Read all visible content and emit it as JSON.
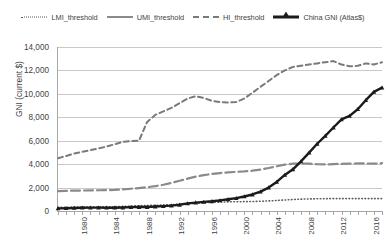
{
  "chart_data": {
    "type": "line",
    "title": "",
    "xlabel": "",
    "ylabel": "GNI (current $)",
    "xlim": [
      1980,
      2020
    ],
    "ylim": [
      0,
      14000
    ],
    "grid": true,
    "legend_position": "top",
    "x": [
      1980,
      1981,
      1982,
      1983,
      1984,
      1985,
      1986,
      1987,
      1988,
      1989,
      1990,
      1991,
      1992,
      1993,
      1994,
      1995,
      1996,
      1997,
      1998,
      1999,
      2000,
      2001,
      2002,
      2003,
      2004,
      2005,
      2006,
      2007,
      2008,
      2009,
      2010,
      2011,
      2012,
      2013,
      2014,
      2015,
      2016,
      2017,
      2018,
      2019,
      2020
    ],
    "x_tick_labels": [
      "1980",
      "1984",
      "1988",
      "1992",
      "1996",
      "2000",
      "2004",
      "2008",
      "2012",
      "2016",
      "2020"
    ],
    "y_tick_labels": [
      "0",
      "2,000",
      "4,000",
      "6,000",
      "8,000",
      "10,000",
      "12,000",
      "14,000"
    ],
    "y_ticks": [
      0,
      2000,
      4000,
      6000,
      8000,
      10000,
      12000,
      14000
    ],
    "series": [
      {
        "name": "LMI_threshold",
        "style": "dotted",
        "color": "#5d5d5d",
        "values": [
          310,
          320,
          330,
          340,
          340,
          350,
          360,
          370,
          390,
          420,
          450,
          470,
          490,
          510,
          540,
          580,
          620,
          660,
          700,
          740,
          760,
          780,
          790,
          800,
          810,
          830,
          860,
          900,
          940,
          980,
          1010,
          1030,
          1040,
          1050,
          1060,
          1060,
          1060,
          1060,
          1060,
          1060,
          1060
        ]
      },
      {
        "name": "UMI_threshold",
        "style": "solid-thin",
        "color": "#8a8a8a",
        "values": [
          1700,
          1720,
          1740,
          1750,
          1760,
          1770,
          1780,
          1800,
          1850,
          1900,
          1960,
          2030,
          2120,
          2240,
          2400,
          2580,
          2760,
          2930,
          3060,
          3160,
          3240,
          3300,
          3340,
          3380,
          3440,
          3540,
          3670,
          3820,
          3960,
          4040,
          4060,
          4040,
          4000,
          3980,
          4000,
          4030,
          4050,
          4060,
          4060,
          4040,
          4080
        ]
      },
      {
        "name": "HI_threshold",
        "style": "dashed",
        "color": "#7a7a7a",
        "values": [
          4500,
          4700,
          4900,
          5050,
          5200,
          5350,
          5500,
          5700,
          5900,
          5980,
          6000,
          7600,
          8200,
          8500,
          8800,
          9200,
          9600,
          9800,
          9650,
          9400,
          9300,
          9260,
          9300,
          9600,
          10100,
          10600,
          11100,
          11600,
          12000,
          12300,
          12400,
          12500,
          12600,
          12700,
          12800,
          12500,
          12350,
          12400,
          12600,
          12500,
          12700
        ]
      },
      {
        "name": "China GNI (Atlas$)",
        "style": "thick-marker",
        "color": "#1b1b1b",
        "values": [
          220,
          240,
          260,
          280,
          290,
          290,
          280,
          280,
          300,
          330,
          340,
          340,
          380,
          420,
          460,
          530,
          650,
          720,
          780,
          830,
          910,
          1000,
          1100,
          1240,
          1410,
          1650,
          2000,
          2480,
          3080,
          3560,
          4240,
          4980,
          5740,
          6420,
          7130,
          7820,
          8120,
          8690,
          9460,
          10170,
          10530
        ]
      }
    ]
  },
  "legend": {
    "items": [
      {
        "label": "LMI_threshold",
        "key": "dotted-line-key"
      },
      {
        "label": "UMI_threshold",
        "key": "solid-line-key"
      },
      {
        "label": "HI_threshold",
        "key": "dashed-line-key"
      },
      {
        "label": "China GNI (Atlas$)",
        "key": "thick-line-marker-key"
      }
    ]
  },
  "axes": {
    "y_title": "GNI (current $)"
  }
}
